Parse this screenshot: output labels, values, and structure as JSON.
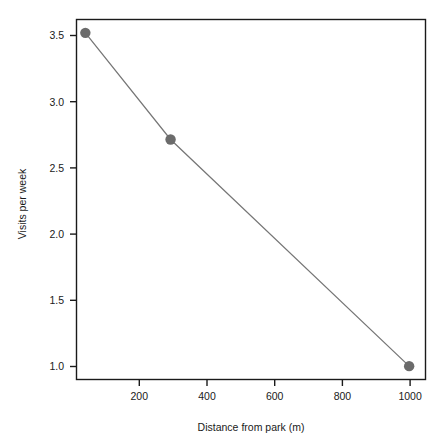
{
  "chart_data": {
    "type": "line",
    "title": "",
    "subtitle": "",
    "xlabel": "Distance from park (m)",
    "ylabel": "Visits per week",
    "x": [
      50,
      300,
      1000
    ],
    "values": [
      3.5,
      2.7,
      1.0
    ],
    "series": [
      {
        "name": "Visits per week",
        "x": [
          50,
          300,
          1000
        ],
        "values": [
          3.5,
          2.7,
          1.0
        ],
        "marker": "filled-circle",
        "marker_color": "#6b6b6b",
        "line_color": "#767676"
      }
    ],
    "points": [
      {
        "x": 50,
        "y": 3.5
      },
      {
        "x": 300,
        "y": 2.7
      },
      {
        "x": 1000,
        "y": 1.0
      }
    ],
    "xlim": [
      24,
      1048
    ],
    "ylim": [
      0.9,
      3.6
    ],
    "xticks": [
      200,
      400,
      600,
      800,
      1000
    ],
    "xtick_labels": [
      "200",
      "400",
      "600",
      "800",
      "1000"
    ],
    "yticks": [
      1.0,
      1.5,
      2.0,
      2.5,
      3.0,
      3.5
    ],
    "ytick_labels": [
      "1.0",
      "1.5",
      "2.0",
      "2.5",
      "3.0",
      "3.5"
    ],
    "grid": false,
    "legend": false,
    "legend_position": "none",
    "background_color": "#ffffff",
    "frame_color": "#1a1a1a"
  }
}
